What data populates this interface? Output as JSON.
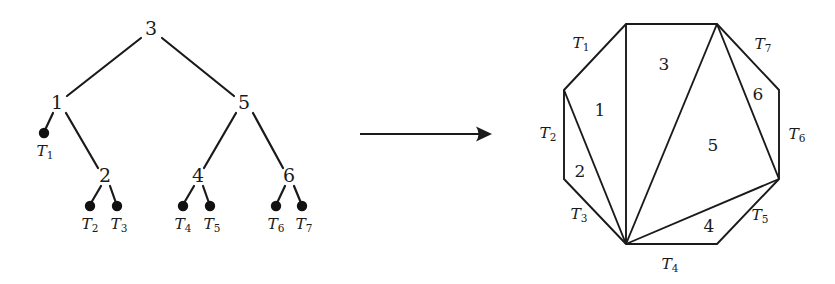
{
  "figure": {
    "background_color": "#ffffff",
    "stroke_color": "#1a1a1a"
  },
  "transform_arrow": {
    "name": "maps-to-arrow",
    "label": "",
    "x1": 360,
    "y1": 134,
    "x2": 492,
    "y2": 134
  },
  "tree": {
    "caption": "",
    "nodes": [
      {
        "id": "n3",
        "label": "3",
        "x": 151,
        "y": 30
      },
      {
        "id": "n1",
        "label": "1",
        "x": 57,
        "y": 104
      },
      {
        "id": "n5",
        "label": "5",
        "x": 244,
        "y": 104
      },
      {
        "id": "n2",
        "label": "2",
        "x": 105,
        "y": 177
      },
      {
        "id": "n4",
        "label": "4",
        "x": 198,
        "y": 177
      },
      {
        "id": "n6",
        "label": "6",
        "x": 289,
        "y": 177
      }
    ],
    "leaves": [
      {
        "id": "l1",
        "label": "T",
        "sub": "1",
        "dot_x": 44,
        "dot_y": 133,
        "label_x": 45,
        "label_y": 152
      },
      {
        "id": "l2",
        "label": "T",
        "sub": "2",
        "dot_x": 90,
        "dot_y": 206,
        "label_x": 90,
        "label_y": 225
      },
      {
        "id": "l3",
        "label": "T",
        "sub": "3",
        "dot_x": 117,
        "dot_y": 206,
        "label_x": 119,
        "label_y": 225
      },
      {
        "id": "l4",
        "label": "T",
        "sub": "4",
        "dot_x": 183,
        "dot_y": 206,
        "label_x": 183,
        "label_y": 225
      },
      {
        "id": "l5",
        "label": "T",
        "sub": "5",
        "dot_x": 210,
        "dot_y": 206,
        "label_x": 212,
        "label_y": 225
      },
      {
        "id": "l6",
        "label": "T",
        "sub": "6",
        "dot_x": 276,
        "dot_y": 206,
        "label_x": 276,
        "label_y": 225
      },
      {
        "id": "l7",
        "label": "T",
        "sub": "7",
        "dot_x": 302,
        "dot_y": 206,
        "label_x": 304,
        "label_y": 225
      }
    ],
    "edges": [
      {
        "from": "n3",
        "to": "n1",
        "x1": 141,
        "y1": 38,
        "x2": 67,
        "y2": 96
      },
      {
        "from": "n3",
        "to": "n5",
        "x1": 162,
        "y1": 38,
        "x2": 234,
        "y2": 96
      },
      {
        "from": "n1",
        "to": "l1",
        "x1": 53,
        "y1": 113,
        "x2": 45,
        "y2": 130
      },
      {
        "from": "n1",
        "to": "n2",
        "x1": 66,
        "y1": 113,
        "x2": 98,
        "y2": 168
      },
      {
        "from": "n5",
        "to": "n4",
        "x1": 236,
        "y1": 113,
        "x2": 204,
        "y2": 168
      },
      {
        "from": "n5",
        "to": "n6",
        "x1": 253,
        "y1": 113,
        "x2": 283,
        "y2": 168
      },
      {
        "from": "n2",
        "to": "l2",
        "x1": 101,
        "y1": 186,
        "x2": 91,
        "y2": 203
      },
      {
        "from": "n2",
        "to": "l3",
        "x1": 110,
        "y1": 186,
        "x2": 116,
        "y2": 203
      },
      {
        "from": "n4",
        "to": "l4",
        "x1": 194,
        "y1": 186,
        "x2": 184,
        "y2": 203
      },
      {
        "from": "n4",
        "to": "l5",
        "x1": 203,
        "y1": 186,
        "x2": 209,
        "y2": 203
      },
      {
        "from": "n6",
        "to": "l6",
        "x1": 285,
        "y1": 186,
        "x2": 277,
        "y2": 203
      },
      {
        "from": "n6",
        "to": "l7",
        "x1": 294,
        "y1": 186,
        "x2": 301,
        "y2": 203
      }
    ]
  },
  "polygon": {
    "sides": 8,
    "vertices": [
      {
        "id": "v0",
        "x": 626,
        "y": 24
      },
      {
        "id": "v1",
        "x": 717,
        "y": 24
      },
      {
        "id": "v2",
        "x": 779,
        "y": 90
      },
      {
        "id": "v3",
        "x": 779,
        "y": 179
      },
      {
        "id": "v4",
        "x": 717,
        "y": 244
      },
      {
        "id": "v5",
        "x": 626,
        "y": 244
      },
      {
        "id": "v6",
        "x": 564,
        "y": 179
      },
      {
        "id": "v7",
        "x": 564,
        "y": 90
      }
    ],
    "diagonals": [
      {
        "id": "d1",
        "from": "v0",
        "to": "v5"
      },
      {
        "id": "d2",
        "from": "v1",
        "to": "v5"
      },
      {
        "id": "d3",
        "from": "v7",
        "to": "v5"
      },
      {
        "id": "d4",
        "from": "v1",
        "to": "v3"
      },
      {
        "id": "d5",
        "from": "v3",
        "to": "v5"
      }
    ],
    "region_labels": [
      {
        "id": "r1",
        "label": "1",
        "x": 600,
        "y": 111
      },
      {
        "id": "r2",
        "label": "2",
        "x": 580,
        "y": 172
      },
      {
        "id": "r3",
        "label": "3",
        "x": 664,
        "y": 65
      },
      {
        "id": "r4",
        "label": "4",
        "x": 709,
        "y": 227
      },
      {
        "id": "r5",
        "label": "5",
        "x": 713,
        "y": 146
      },
      {
        "id": "r6",
        "label": "6",
        "x": 758,
        "y": 95
      }
    ],
    "side_labels": [
      {
        "id": "s1",
        "label": "T",
        "sub": "1",
        "x": 581,
        "y": 44
      },
      {
        "id": "s2",
        "label": "T",
        "sub": "2",
        "x": 548,
        "y": 134
      },
      {
        "id": "s3",
        "label": "T",
        "sub": "3",
        "x": 579,
        "y": 215
      },
      {
        "id": "s4",
        "label": "T",
        "sub": "4",
        "x": 670,
        "y": 265
      },
      {
        "id": "s5",
        "label": "T",
        "sub": "5",
        "x": 760,
        "y": 216
      },
      {
        "id": "s6",
        "label": "T",
        "sub": "6",
        "x": 797,
        "y": 135
      },
      {
        "id": "s7",
        "label": "T",
        "sub": "7",
        "x": 763,
        "y": 45
      }
    ]
  }
}
